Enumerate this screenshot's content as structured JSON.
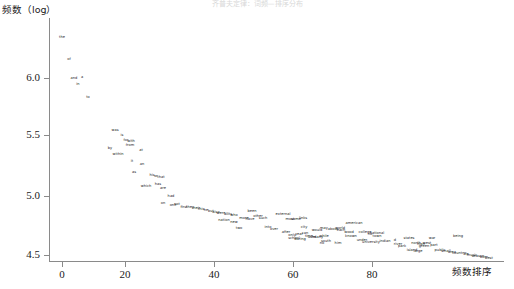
{
  "title_faint": "齐普夫定律：词频—排序分布",
  "axes": {
    "ylabel": "频数（log）",
    "xlabel": "频数排序",
    "yticks": [
      "6.0",
      "5.5",
      "5.0",
      "4.5"
    ],
    "ytick_values": [
      6.0,
      5.5,
      5.0,
      4.5
    ],
    "xticks": [
      "0",
      "20",
      "40",
      "60",
      "80"
    ],
    "xtick_values": [
      0,
      20,
      40,
      60,
      80
    ]
  },
  "chart_data": {
    "type": "scatter",
    "title": "齐普夫定律：词频—排序分布",
    "xlabel": "频数排序",
    "ylabel": "频数（log）",
    "xlim": [
      -3,
      103
    ],
    "ylim": [
      4.35,
      6.35
    ],
    "grid": false,
    "legend": false,
    "marker": "text-label",
    "note": "Each point is drawn as the word itself rather than a marker glyph; Zipf rank-frequency curve.",
    "x": [
      1,
      2,
      3,
      4,
      5,
      6,
      7,
      8,
      9,
      10,
      11,
      12,
      13,
      14,
      15,
      16,
      17,
      18,
      19,
      20,
      21,
      22,
      23,
      24,
      25,
      26,
      27,
      28,
      29,
      30,
      31,
      32,
      33,
      34,
      35,
      36,
      37,
      38,
      39,
      40,
      41,
      42,
      43,
      44,
      45,
      46,
      47,
      48,
      49,
      50,
      51,
      52,
      53,
      54,
      55,
      56,
      57,
      58,
      59,
      60,
      61,
      62,
      63,
      64,
      65,
      66,
      67,
      68,
      69,
      70,
      71,
      72,
      73,
      74,
      75,
      76,
      77,
      78,
      79,
      80,
      81,
      82,
      83,
      84,
      85,
      86,
      87,
      88,
      89,
      90,
      91,
      92,
      93,
      94,
      95,
      96,
      97,
      98,
      99,
      100
    ],
    "y": [
      6.28,
      6.12,
      5.98,
      5.97,
      5.95,
      5.86,
      5.56,
      5.54,
      5.5,
      5.47,
      5.44,
      5.42,
      5.4,
      5.38,
      5.35,
      5.3,
      5.26,
      5.22,
      5.2,
      5.17,
      5.15,
      5.12,
      5.1,
      5.08,
      5.06,
      5.04,
      5.02,
      5.0,
      4.98,
      4.96,
      4.95,
      4.93,
      4.92,
      4.9,
      4.89,
      4.88,
      4.87,
      4.86,
      4.85,
      4.84,
      4.83,
      4.82,
      4.81,
      4.8,
      4.79,
      4.78,
      4.77,
      4.76,
      4.75,
      4.74,
      4.74,
      4.73,
      4.72,
      4.72,
      4.71,
      4.7,
      4.69,
      4.69,
      4.68,
      4.67,
      4.66,
      4.66,
      4.65,
      4.65,
      4.64,
      4.64,
      4.63,
      4.63,
      4.62,
      4.62,
      4.61,
      4.61,
      4.6,
      4.6,
      4.59,
      4.59,
      4.58,
      4.58,
      4.57,
      4.57,
      4.56,
      4.56,
      4.55,
      4.55,
      4.54,
      4.54,
      4.53,
      4.53,
      4.52,
      4.52,
      4.51,
      4.51,
      4.5,
      4.5,
      4.49,
      4.48,
      4.47,
      4.46,
      4.45,
      4.44
    ],
    "labels": [
      "the",
      "of",
      "and",
      "a",
      "in",
      "to",
      "was",
      "is",
      "for",
      "with",
      "by",
      "from",
      "within",
      "at",
      "it",
      "an",
      "as",
      "his",
      "or",
      "that",
      "which",
      "has",
      "are",
      "had",
      "on",
      "one",
      "not",
      "first",
      "they",
      "their",
      "this",
      "he",
      "but",
      "also",
      "were",
      "all",
      "its",
      "who",
      "more",
      "have",
      "new",
      "been",
      "other",
      "such",
      "into",
      "over",
      "external",
      "two",
      "most",
      "some",
      "links",
      "nation",
      "after",
      "only",
      "year",
      "can",
      "used",
      "city",
      "school",
      "during",
      "time",
      "may",
      "would",
      "also",
      "while",
      "many",
      "american",
      "world",
      "state",
      "south",
      "wood",
      "known",
      "college",
      "under",
      "university",
      "indian",
      "his",
      "him",
      "no",
      "town",
      "national",
      "river",
      "park",
      "states",
      "war",
      "being",
      "part",
      "north",
      "high",
      "west",
      "green",
      "island",
      "large",
      "public",
      "small",
      "area",
      "country",
      "south",
      "life",
      "music"
    ]
  },
  "words": [
    {
      "t": "the",
      "x": 62,
      "y": 37
    },
    {
      "t": "of",
      "x": 69,
      "y": 59
    },
    {
      "t": "and",
      "x": 74,
      "y": 78
    },
    {
      "t": "a",
      "x": 82,
      "y": 77
    },
    {
      "t": "in",
      "x": 78,
      "y": 84
    },
    {
      "t": "to",
      "x": 88,
      "y": 97
    },
    {
      "t": "was",
      "x": 115,
      "y": 130
    },
    {
      "t": "is",
      "x": 122,
      "y": 135
    },
    {
      "t": "for",
      "x": 126,
      "y": 140
    },
    {
      "t": "with",
      "x": 131,
      "y": 141
    },
    {
      "t": "by",
      "x": 110,
      "y": 148
    },
    {
      "t": "from",
      "x": 130,
      "y": 145
    },
    {
      "t": "within",
      "x": 118,
      "y": 154
    },
    {
      "t": "at",
      "x": 141,
      "y": 150
    },
    {
      "t": "it",
      "x": 132,
      "y": 161
    },
    {
      "t": "an",
      "x": 142,
      "y": 164
    },
    {
      "t": "as",
      "x": 134,
      "y": 172
    },
    {
      "t": "his",
      "x": 152,
      "y": 175
    },
    {
      "t": "or",
      "x": 156,
      "y": 176
    },
    {
      "t": "that",
      "x": 161,
      "y": 177
    },
    {
      "t": "which",
      "x": 146,
      "y": 186
    },
    {
      "t": "has",
      "x": 158,
      "y": 184
    },
    {
      "t": "are",
      "x": 163,
      "y": 188
    },
    {
      "t": "had",
      "x": 171,
      "y": 196
    },
    {
      "t": "on",
      "x": 163,
      "y": 203
    },
    {
      "t": "one",
      "x": 173,
      "y": 205
    },
    {
      "t": "not",
      "x": 177,
      "y": 204
    },
    {
      "t": "first",
      "x": 184,
      "y": 207
    },
    {
      "t": "they",
      "x": 190,
      "y": 207
    },
    {
      "t": "their",
      "x": 196,
      "y": 208
    },
    {
      "t": "this",
      "x": 201,
      "y": 209
    },
    {
      "t": "he",
      "x": 206,
      "y": 210
    },
    {
      "t": "but",
      "x": 211,
      "y": 211
    },
    {
      "t": "also",
      "x": 216,
      "y": 212
    },
    {
      "t": "were",
      "x": 221,
      "y": 213
    },
    {
      "t": "all",
      "x": 226,
      "y": 214
    },
    {
      "t": "its",
      "x": 230,
      "y": 214
    },
    {
      "t": "who",
      "x": 234,
      "y": 215
    },
    {
      "t": "more",
      "x": 244,
      "y": 218
    },
    {
      "t": "have",
      "x": 250,
      "y": 219
    },
    {
      "t": "new",
      "x": 234,
      "y": 222
    },
    {
      "t": "been",
      "x": 252,
      "y": 211
    },
    {
      "t": "other",
      "x": 258,
      "y": 216
    },
    {
      "t": "such",
      "x": 263,
      "y": 218
    },
    {
      "t": "into",
      "x": 268,
      "y": 227
    },
    {
      "t": "over",
      "x": 274,
      "y": 229
    },
    {
      "t": "external",
      "x": 283,
      "y": 214
    },
    {
      "t": "two",
      "x": 239,
      "y": 228
    },
    {
      "t": "most",
      "x": 290,
      "y": 219
    },
    {
      "t": "some",
      "x": 296,
      "y": 219
    },
    {
      "t": "links",
      "x": 303,
      "y": 218
    },
    {
      "t": "nation",
      "x": 224,
      "y": 220
    },
    {
      "t": "after",
      "x": 286,
      "y": 232
    },
    {
      "t": "only",
      "x": 292,
      "y": 235
    },
    {
      "t": "year",
      "x": 299,
      "y": 234
    },
    {
      "t": "can",
      "x": 305,
      "y": 233
    },
    {
      "t": "used",
      "x": 312,
      "y": 237
    },
    {
      "t": "city",
      "x": 304,
      "y": 227
    },
    {
      "t": "school",
      "x": 294,
      "y": 238
    },
    {
      "t": "during",
      "x": 300,
      "y": 239
    },
    {
      "t": "time",
      "x": 309,
      "y": 236
    },
    {
      "t": "may",
      "x": 324,
      "y": 228
    },
    {
      "t": "would",
      "x": 317,
      "y": 230
    },
    {
      "t": "about",
      "x": 333,
      "y": 229
    },
    {
      "t": "while",
      "x": 324,
      "y": 236
    },
    {
      "t": "many",
      "x": 318,
      "y": 237
    },
    {
      "t": "american",
      "x": 354,
      "y": 223
    },
    {
      "t": "world",
      "x": 340,
      "y": 228
    },
    {
      "t": "each",
      "x": 341,
      "y": 230
    },
    {
      "t": "south",
      "x": 326,
      "y": 241
    },
    {
      "t": "no",
      "x": 322,
      "y": 243
    },
    {
      "t": "wood",
      "x": 349,
      "y": 232
    },
    {
      "t": "known",
      "x": 351,
      "y": 236
    },
    {
      "t": "college",
      "x": 365,
      "y": 232
    },
    {
      "t": "under",
      "x": 362,
      "y": 240
    },
    {
      "t": "university",
      "x": 371,
      "y": 242
    },
    {
      "t": "indian",
      "x": 385,
      "y": 241
    },
    {
      "t": "him",
      "x": 338,
      "y": 243
    },
    {
      "t": "d",
      "x": 395,
      "y": 240
    },
    {
      "t": "no",
      "x": 370,
      "y": 234
    },
    {
      "t": "town",
      "x": 377,
      "y": 236
    },
    {
      "t": "national",
      "x": 377,
      "y": 233
    },
    {
      "t": "river",
      "x": 398,
      "y": 244
    },
    {
      "t": "park",
      "x": 402,
      "y": 246
    },
    {
      "t": "states",
      "x": 409,
      "y": 238
    },
    {
      "t": "war",
      "x": 432,
      "y": 238
    },
    {
      "t": "being",
      "x": 458,
      "y": 236
    },
    {
      "t": "part",
      "x": 434,
      "y": 245
    },
    {
      "t": "north",
      "x": 416,
      "y": 243
    },
    {
      "t": "high",
      "x": 421,
      "y": 244
    },
    {
      "t": "west",
      "x": 427,
      "y": 243
    },
    {
      "t": "green",
      "x": 424,
      "y": 246
    },
    {
      "t": "island",
      "x": 412,
      "y": 250
    },
    {
      "t": "large",
      "x": 418,
      "y": 251
    },
    {
      "t": "public",
      "x": 440,
      "y": 250
    },
    {
      "t": "small",
      "x": 446,
      "y": 251
    },
    {
      "t": "area",
      "x": 452,
      "y": 252
    },
    {
      "t": "country",
      "x": 459,
      "y": 253
    },
    {
      "t": "life",
      "x": 466,
      "y": 254
    },
    {
      "t": "music",
      "x": 472,
      "y": 255
    },
    {
      "t": "season",
      "x": 478,
      "y": 256
    },
    {
      "t": "born",
      "x": 484,
      "y": 257
    },
    {
      "t": "best",
      "x": 489,
      "y": 258
    }
  ]
}
